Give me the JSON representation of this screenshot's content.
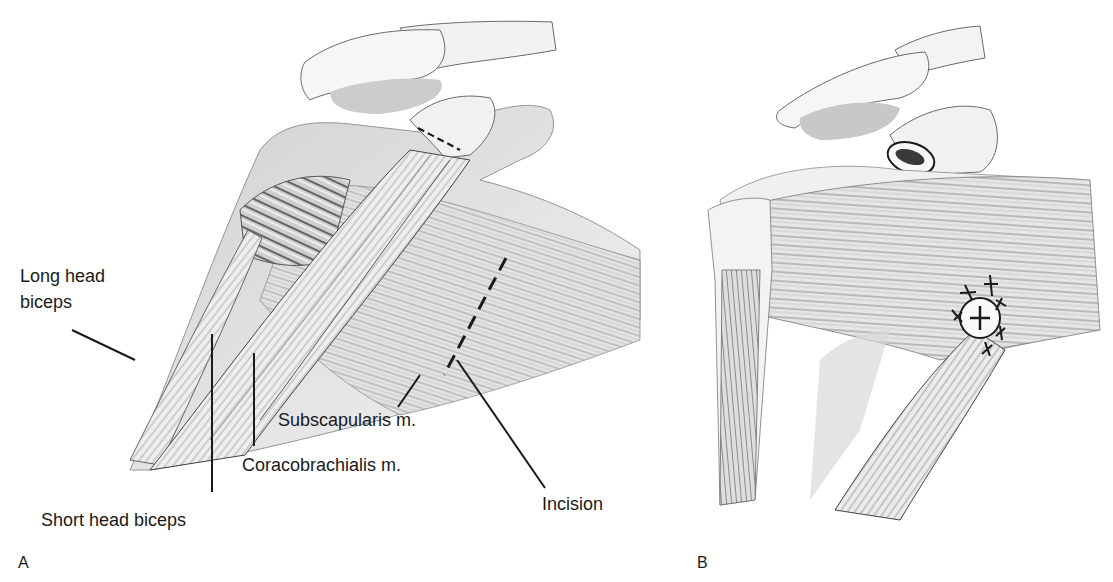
{
  "figure": {
    "panels": [
      {
        "id": "A",
        "letter": "A",
        "labels": {
          "long_head_biceps_line1": "Long head",
          "long_head_biceps_line2": "biceps",
          "short_head_biceps": "Short head biceps",
          "coracobrachialis": "Coracobrachialis m.",
          "subscapularis": "Subscapularis m.",
          "incision": "Incision"
        }
      },
      {
        "id": "B",
        "letter": "B"
      }
    ],
    "colors": {
      "ink": "#1a1a1a",
      "shade_dark": "#6e6e6e",
      "shade_mid": "#a8a8a8",
      "shade_light": "#d8d8d8",
      "background": "#ffffff"
    }
  }
}
